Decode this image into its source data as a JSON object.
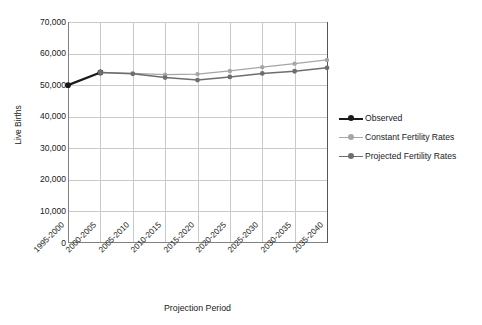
{
  "chart_data": {
    "type": "line",
    "title": "",
    "xlabel": "Projection Period",
    "ylabel": "Live Births",
    "categories": [
      "1995-2000",
      "2000-2005",
      "2005-2010",
      "2010-2015",
      "2015-2020",
      "2020-2025",
      "2025-2030",
      "2030-2035",
      "2035-2040"
    ],
    "yticks": [
      "0",
      "10,000",
      "20,000",
      "30,000",
      "40,000",
      "50,000",
      "60,000",
      "70,000"
    ],
    "ytick_values": [
      0,
      10000,
      20000,
      30000,
      40000,
      50000,
      60000,
      70000
    ],
    "ylim": [
      0,
      70000
    ],
    "grid": true,
    "legend_position": "right",
    "series": [
      {
        "name": "Observed",
        "color": "#1a1a1a",
        "values": [
          50000,
          54000,
          null,
          null,
          null,
          null,
          null,
          null,
          null
        ]
      },
      {
        "name": "Constant Fertility Rates",
        "color": "#a6a6a6",
        "values": [
          null,
          54000,
          53700,
          53300,
          53500,
          54500,
          55700,
          56800,
          58000
        ]
      },
      {
        "name": "Projected Fertility Rates",
        "color": "#6e6e6e",
        "values": [
          null,
          54000,
          53600,
          52400,
          51600,
          52600,
          53700,
          54400,
          55500
        ]
      }
    ]
  },
  "legend": {
    "items": [
      {
        "label": "Observed"
      },
      {
        "label": "Constant Fertility Rates"
      },
      {
        "label": "Projected Fertility Rates"
      }
    ]
  }
}
